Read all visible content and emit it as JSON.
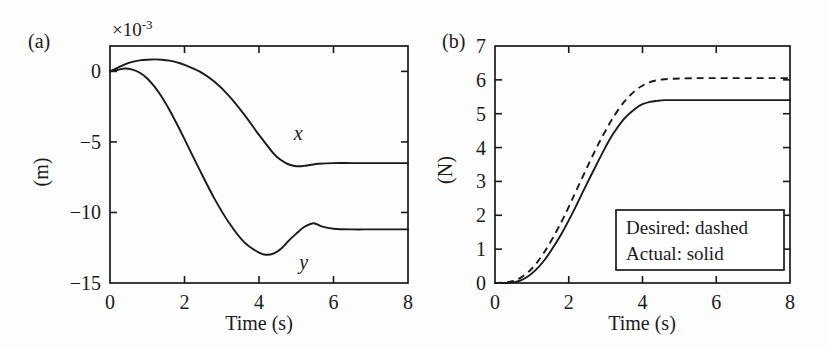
{
  "figure": {
    "panels": [
      {
        "id": "a",
        "label": "(a)",
        "exponent_prefix": "×10",
        "exponent_power": "-3",
        "ylabel": "(m)",
        "xlabel": "Time (s)",
        "xticks": [
          "0",
          "2",
          "4",
          "6",
          "8"
        ],
        "yticks": [
          "0",
          "−5",
          "−10",
          "−15"
        ],
        "series_labels": [
          "x",
          "y"
        ]
      },
      {
        "id": "b",
        "label": "(b)",
        "ylabel": "(N)",
        "xlabel": "Time (s)",
        "xticks": [
          "0",
          "2",
          "4",
          "6",
          "8"
        ],
        "yticks": [
          "0",
          "1",
          "2",
          "3",
          "4",
          "5",
          "6",
          "7"
        ],
        "legend": [
          "Desired: dashed",
          "Actual: solid"
        ]
      }
    ],
    "line_color": "#1a1a1a",
    "background_color": "#fdfdfd"
  },
  "chart_data": [
    {
      "type": "line",
      "panel": "a",
      "title": "(a)",
      "xlabel": "Time (s)",
      "ylabel": "(m)",
      "y_scale_factor": "×10^-3",
      "xlim": [
        0,
        8
      ],
      "ylim": [
        -15,
        1.8
      ],
      "xticks": [
        0,
        2,
        4,
        6,
        8
      ],
      "yticks": [
        0,
        -5,
        -10,
        -15
      ],
      "grid": false,
      "legend_position": "inline-curve-labels",
      "series": [
        {
          "name": "x",
          "style": "solid",
          "x": [
            0.0,
            0.2,
            0.4,
            0.6,
            0.8,
            1.0,
            1.2,
            1.4,
            1.6,
            1.8,
            2.0,
            2.4,
            2.8,
            3.2,
            3.6,
            4.0,
            4.4,
            4.6,
            4.8,
            5.0,
            5.2,
            5.4,
            5.6,
            6.0,
            6.5,
            7.0,
            7.5,
            8.0
          ],
          "values": [
            0.0,
            0.25,
            0.5,
            0.68,
            0.78,
            0.83,
            0.85,
            0.83,
            0.76,
            0.64,
            0.47,
            0.0,
            -0.72,
            -1.75,
            -3.05,
            -4.5,
            -5.85,
            -6.3,
            -6.6,
            -6.72,
            -6.7,
            -6.62,
            -6.55,
            -6.5,
            -6.5,
            -6.5,
            -6.5,
            -6.5
          ]
        },
        {
          "name": "y",
          "style": "solid",
          "x": [
            0.0,
            0.2,
            0.4,
            0.6,
            0.8,
            1.0,
            1.2,
            1.4,
            1.6,
            1.8,
            2.0,
            2.4,
            2.8,
            3.2,
            3.6,
            4.0,
            4.2,
            4.4,
            4.6,
            4.8,
            5.0,
            5.2,
            5.4,
            5.5,
            5.7,
            6.0,
            6.5,
            7.0,
            7.5,
            8.0
          ],
          "values": [
            0.0,
            0.1,
            0.2,
            0.12,
            -0.1,
            -0.5,
            -1.1,
            -1.85,
            -2.75,
            -3.75,
            -4.8,
            -6.95,
            -9.0,
            -10.75,
            -12.1,
            -12.85,
            -13.0,
            -12.9,
            -12.55,
            -12.0,
            -11.5,
            -11.05,
            -10.8,
            -10.78,
            -11.0,
            -11.15,
            -11.2,
            -11.2,
            -11.2,
            -11.2
          ]
        }
      ],
      "curve_label_positions": [
        {
          "label": "x",
          "x": 5.05,
          "y": -4.85
        },
        {
          "label": "y",
          "x": 5.2,
          "y": -14.0
        }
      ]
    },
    {
      "type": "line",
      "panel": "b",
      "title": "(b)",
      "xlabel": "Time (s)",
      "ylabel": "(N)",
      "xlim": [
        0,
        8
      ],
      "ylim": [
        0,
        7
      ],
      "xticks": [
        0,
        2,
        4,
        6,
        8
      ],
      "yticks": [
        0,
        1,
        2,
        3,
        4,
        5,
        6,
        7
      ],
      "grid": false,
      "legend_position": "inside-lower-right",
      "series": [
        {
          "name": "Desired",
          "style": "dashed",
          "x": [
            0.0,
            0.3,
            0.5,
            0.7,
            0.9,
            1.1,
            1.3,
            1.5,
            1.8,
            2.0,
            2.2,
            2.5,
            2.8,
            3.0,
            3.2,
            3.5,
            3.8,
            4.0,
            4.2,
            4.4,
            4.6,
            4.8,
            5.0,
            5.5,
            6.0,
            6.5,
            7.0,
            7.5,
            8.0
          ],
          "values": [
            0.0,
            0.02,
            0.06,
            0.16,
            0.32,
            0.55,
            0.85,
            1.2,
            1.8,
            2.25,
            2.72,
            3.42,
            4.1,
            4.5,
            4.88,
            5.35,
            5.68,
            5.83,
            5.93,
            5.99,
            6.02,
            6.03,
            6.04,
            6.05,
            6.05,
            6.05,
            6.05,
            6.05,
            6.05
          ]
        },
        {
          "name": "Actual",
          "style": "solid",
          "x": [
            0.0,
            0.3,
            0.5,
            0.7,
            0.9,
            1.1,
            1.3,
            1.5,
            1.8,
            2.0,
            2.2,
            2.5,
            2.8,
            3.0,
            3.2,
            3.5,
            3.8,
            4.0,
            4.2,
            4.4,
            4.6,
            4.8,
            5.0,
            5.5,
            6.0,
            6.5,
            7.0,
            7.5,
            8.0
          ],
          "values": [
            0.0,
            0.0,
            0.02,
            0.08,
            0.2,
            0.38,
            0.62,
            0.92,
            1.45,
            1.85,
            2.28,
            2.95,
            3.6,
            4.02,
            4.4,
            4.85,
            5.15,
            5.28,
            5.35,
            5.38,
            5.4,
            5.4,
            5.4,
            5.4,
            5.4,
            5.4,
            5.4,
            5.4,
            5.4
          ]
        }
      ]
    }
  ]
}
